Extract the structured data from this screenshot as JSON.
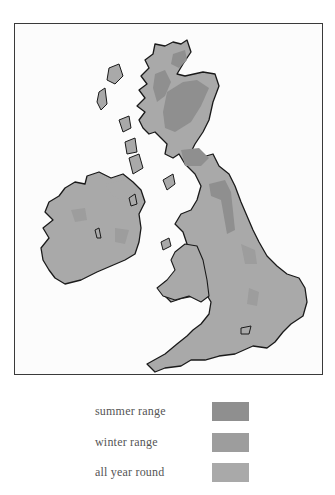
{
  "map": {
    "title": "",
    "region": "British Isles",
    "colors": {
      "summer_range": "#8f8f8f",
      "winter_range": "#9d9d9d",
      "all_year_round": "#a9a9a9",
      "coastline": "#1a1a1a",
      "sea": "#fcfcfc",
      "frame": "#3a3a3a"
    }
  },
  "legend": {
    "items": [
      {
        "label": "summer range",
        "color": "#8f8f8f"
      },
      {
        "label": "winter range",
        "color": "#9d9d9d"
      },
      {
        "label": "all year round",
        "color": "#a9a9a9"
      }
    ]
  }
}
